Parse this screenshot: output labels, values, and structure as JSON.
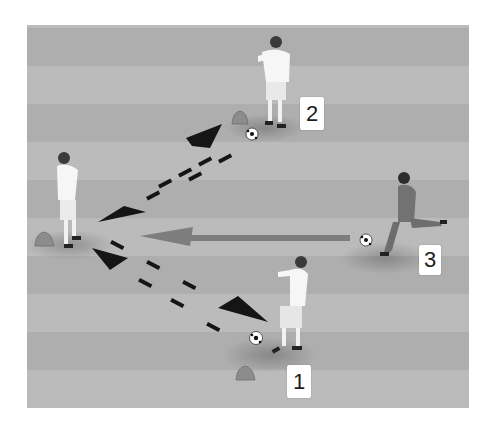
{
  "diagram": {
    "type": "soccer-passing-drill",
    "colors": {
      "field": "#b7b7b7",
      "pass_arrow": "#111111",
      "run_arrow": "#7a7a7a",
      "white_kit": "#f8f8f8",
      "dark_kit": "#6f6f6f",
      "cone": "#8a8a8a",
      "label_bg": "#ffffff",
      "label_text": "#1e1e1e"
    },
    "labels": [
      {
        "id": "player-2",
        "text": "2",
        "x": 300,
        "y": 97,
        "w": 24,
        "h": 33
      },
      {
        "id": "player-3",
        "text": "3",
        "x": 419,
        "y": 245,
        "w": 22,
        "h": 30
      },
      {
        "id": "player-1",
        "text": "1",
        "x": 287,
        "y": 365,
        "w": 24,
        "h": 33
      }
    ],
    "players": [
      {
        "id": "player-2",
        "kit": "white",
        "x": 272,
        "y": 85
      },
      {
        "id": "player-center-left",
        "kit": "white",
        "x": 68,
        "y": 205
      },
      {
        "id": "player-3",
        "kit": "dark",
        "x": 405,
        "y": 215
      },
      {
        "id": "player-1",
        "kit": "white",
        "x": 295,
        "y": 310
      }
    ],
    "balls": [
      {
        "x": 252,
        "y": 134
      },
      {
        "x": 366,
        "y": 240
      },
      {
        "x": 256,
        "y": 338
      }
    ],
    "cones": [
      {
        "x": 240,
        "y": 120
      },
      {
        "x": 42,
        "y": 240
      },
      {
        "x": 246,
        "y": 374
      }
    ],
    "arrows": [
      {
        "type": "dashed-pass",
        "from": "player-center-left",
        "to": "player-2"
      },
      {
        "type": "dashed-pass",
        "from": "player-2",
        "to": "player-center-left"
      },
      {
        "type": "dashed-pass",
        "from": "player-center-left",
        "to": "player-1"
      },
      {
        "type": "dashed-pass",
        "from": "player-1",
        "to": "player-center-left"
      },
      {
        "type": "solid-run",
        "from": "player-3",
        "to": "player-center-left"
      }
    ]
  }
}
